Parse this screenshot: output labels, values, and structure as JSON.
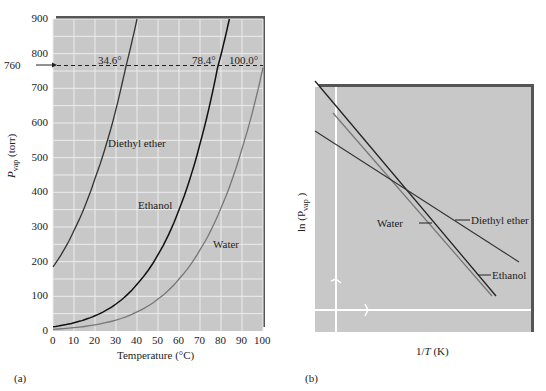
{
  "chart_data": [
    {
      "panel": "(a)",
      "type": "line",
      "title": "",
      "xlabel": "Temperature (°C)",
      "ylabel": "P_vap (torr)",
      "xlim": [
        0,
        100
      ],
      "ylim": [
        0,
        900
      ],
      "xticks": [
        "0",
        "10",
        "20",
        "30",
        "40",
        "50",
        "60",
        "70",
        "80",
        "90",
        "100"
      ],
      "yticks": [
        "0",
        "100",
        "200",
        "300",
        "400",
        "500",
        "600",
        "700",
        "800",
        "900"
      ],
      "grid": true,
      "reference_line": {
        "y": 760,
        "label": "760",
        "style": "dashed"
      },
      "boiling_point_labels": [
        "34.6°",
        "78.4°",
        "100.0°"
      ],
      "series": [
        {
          "name": "Diethyl ether",
          "x": [
            0,
            10,
            20,
            30,
            34.6,
            40
          ],
          "y": [
            185,
            290,
            440,
            640,
            760,
            900
          ]
        },
        {
          "name": "Ethanol",
          "x": [
            0,
            10,
            20,
            30,
            40,
            50,
            60,
            70,
            78.4,
            84
          ],
          "y": [
            12,
            24,
            44,
            78,
            135,
            220,
            350,
            540,
            760,
            900
          ]
        },
        {
          "name": "Water",
          "x": [
            0,
            20,
            40,
            50,
            60,
            70,
            80,
            90,
            100
          ],
          "y": [
            5,
            18,
            55,
            92,
            150,
            234,
            355,
            526,
            760
          ]
        }
      ]
    },
    {
      "panel": "(b)",
      "type": "line",
      "title": "",
      "xlabel": "1/T (K)",
      "ylabel": "ln (P_vap)",
      "grid": false,
      "series": [
        {
          "name": "Diethyl ether"
        },
        {
          "name": "Ethanol"
        },
        {
          "name": "Water"
        }
      ]
    }
  ],
  "labels": {
    "a_panel": "(a)",
    "b_panel": "(b)",
    "a_xlabel": "Temperature (°C)",
    "a_ylabel_main": "P",
    "a_ylabel_sub": "vap",
    "a_ylabel_unit": " (torr)",
    "ref_760": "760",
    "bp_ether": "34.6°",
    "bp_ethanol": "78.4°",
    "bp_water": "100.0°",
    "a_diethyl": "Diethyl ether",
    "a_ethanol": "Ethanol",
    "a_water": "Water",
    "b_xlabel_pre": "1/",
    "b_xlabel_T": "T",
    "b_xlabel_post": " (K)",
    "b_ylabel": "ln (P",
    "b_ylabel_sub": "vap",
    "b_ylabel_end": " )",
    "b_diethyl": "Diethyl ether",
    "b_ethanol": "Ethanol",
    "b_water": "Water"
  },
  "colors": {
    "plot_bg": "#c8c8c8",
    "grid": "#ececec",
    "ether": "#333333",
    "ethanol": "#111111",
    "water": "#666666",
    "frame_shadow": "#555555"
  }
}
